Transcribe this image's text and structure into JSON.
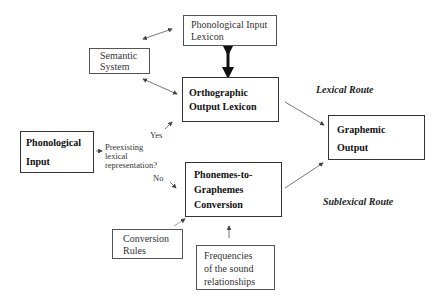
{
  "nodes": {
    "phonological_input_lexicon": {
      "line1": "Phonological Input",
      "line2": "Lexicon"
    },
    "semantic_system": {
      "line1": "Semantic",
      "line2": "System"
    },
    "orthographic_output_lexicon": {
      "line1": "Orthographic",
      "line2": "Output Lexicon"
    },
    "phonological_input": {
      "line1": "Phonological",
      "line2": "Input"
    },
    "graphemic_output": {
      "line1": "Graphemic",
      "line2": "Output"
    },
    "phonemes_to_graphemes": {
      "line1": "Phonemes-to-",
      "line2": "Graphemes",
      "line3": "Conversion"
    },
    "conversion_rules": {
      "line1": "Conversion",
      "line2": "Rules"
    },
    "frequencies": {
      "line1": "Frequencies",
      "line2": "of the sound",
      "line3": "relationships"
    }
  },
  "labels": {
    "question_line1": "Preexisting",
    "question_line2": "lexical",
    "question_line3": "representation?",
    "yes": "Yes",
    "no": "No",
    "lexical_route": "Lexical Route",
    "sublexical_route": "Sublexical Route"
  },
  "colors": {
    "line": "#444444",
    "text": "#222222",
    "background": "#ffffff"
  }
}
